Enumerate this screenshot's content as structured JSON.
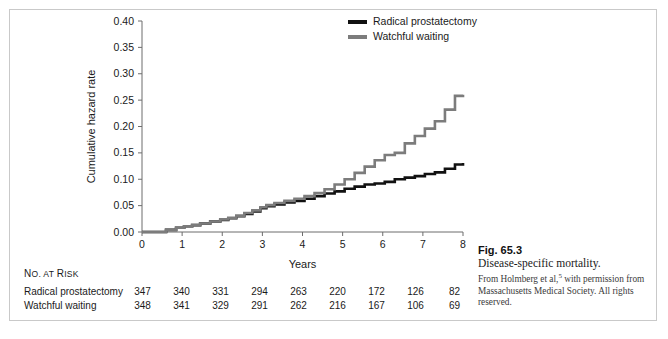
{
  "figure": {
    "number": "Fig. 65.3",
    "title": "Disease-specific mortality.",
    "credit_part1": "From Holmberg et al,",
    "credit_superscript": "5",
    "credit_part2": " with permission from Massachusetts Medical Society. All rights reserved."
  },
  "legend": {
    "items": [
      {
        "label": "Radical prostatectomy",
        "color": "#111111"
      },
      {
        "label": "Watchful waiting",
        "color": "#7c7c7c"
      }
    ]
  },
  "risk_table": {
    "title_small": "O. AT ",
    "title_lead": "N",
    "title_risk_lead": "R",
    "title_risk_rest": "ISK",
    "rows": [
      {
        "name": "Radical prostatectomy",
        "values": [
          347,
          340,
          331,
          294,
          263,
          220,
          172,
          126,
          82
        ]
      },
      {
        "name": "Watchful waiting",
        "values": [
          348,
          341,
          329,
          291,
          262,
          216,
          167,
          106,
          69
        ]
      }
    ]
  },
  "chart_data": {
    "type": "line",
    "title": "",
    "xlabel": "Years",
    "ylabel": "Cumulative hazard rate",
    "xlim": [
      0,
      8
    ],
    "ylim": [
      0.0,
      0.4
    ],
    "xticks": [
      0,
      1,
      2,
      3,
      4,
      5,
      6,
      7,
      8
    ],
    "yticks": [
      0.0,
      0.05,
      0.1,
      0.15,
      0.2,
      0.25,
      0.3,
      0.35,
      0.4
    ],
    "ytick_labels": [
      "0.00",
      "0.05",
      "0.10",
      "0.15",
      "0.20",
      "0.25",
      "0.30",
      "0.35",
      "0.40"
    ],
    "xtick_labels": [
      "0",
      "1",
      "2",
      "3",
      "4",
      "5",
      "6",
      "7",
      "8"
    ],
    "grid": false,
    "legend_position": "top-right",
    "step_style": "post",
    "series": [
      {
        "name": "Radical prostatectomy",
        "color": "#111111",
        "x": [
          0.0,
          0.35,
          0.6,
          0.85,
          1.05,
          1.25,
          1.45,
          1.7,
          1.95,
          2.15,
          2.35,
          2.55,
          2.75,
          2.95,
          3.1,
          3.3,
          3.55,
          3.8,
          4.05,
          4.3,
          4.55,
          4.8,
          5.05,
          5.3,
          5.55,
          5.8,
          6.05,
          6.3,
          6.55,
          6.8,
          7.05,
          7.3,
          7.55,
          7.8,
          8.0
        ],
        "y": [
          0.0,
          0.0,
          0.004,
          0.008,
          0.011,
          0.013,
          0.016,
          0.02,
          0.023,
          0.026,
          0.03,
          0.034,
          0.039,
          0.045,
          0.049,
          0.052,
          0.056,
          0.059,
          0.063,
          0.068,
          0.073,
          0.077,
          0.082,
          0.086,
          0.09,
          0.092,
          0.095,
          0.1,
          0.103,
          0.106,
          0.11,
          0.113,
          0.12,
          0.128,
          0.131
        ]
      },
      {
        "name": "Watchful waiting",
        "color": "#7c7c7c",
        "x": [
          0.0,
          0.35,
          0.6,
          0.85,
          1.05,
          1.25,
          1.45,
          1.7,
          1.95,
          2.15,
          2.35,
          2.55,
          2.75,
          2.95,
          3.1,
          3.3,
          3.55,
          3.8,
          4.05,
          4.3,
          4.55,
          4.8,
          5.05,
          5.3,
          5.55,
          5.8,
          6.05,
          6.3,
          6.55,
          6.8,
          7.05,
          7.3,
          7.55,
          7.8,
          8.0
        ],
        "y": [
          0.0,
          0.0,
          0.004,
          0.008,
          0.011,
          0.013,
          0.016,
          0.02,
          0.024,
          0.027,
          0.031,
          0.036,
          0.041,
          0.047,
          0.051,
          0.055,
          0.059,
          0.063,
          0.068,
          0.074,
          0.081,
          0.09,
          0.1,
          0.112,
          0.124,
          0.136,
          0.146,
          0.15,
          0.168,
          0.182,
          0.196,
          0.21,
          0.232,
          0.258,
          0.26
        ]
      }
    ]
  }
}
